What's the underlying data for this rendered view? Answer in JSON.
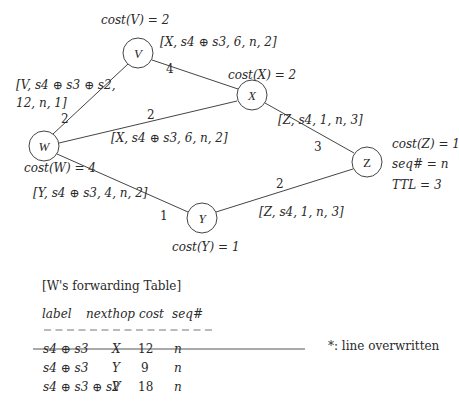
{
  "graph": {
    "nodes": [
      {
        "id": "V",
        "label": "V",
        "cx": 138,
        "cy": 53,
        "r": 15
      },
      {
        "id": "X",
        "label": "X",
        "cx": 252,
        "cy": 95,
        "r": 15
      },
      {
        "id": "W",
        "label": "W",
        "cx": 44,
        "cy": 146,
        "r": 15
      },
      {
        "id": "Z",
        "label": "Z",
        "cx": 367,
        "cy": 162,
        "r": 15
      },
      {
        "id": "Y",
        "label": "Y",
        "cx": 202,
        "cy": 218,
        "r": 15
      }
    ],
    "edges": [
      {
        "from": "W",
        "to": "V",
        "weight": "2"
      },
      {
        "from": "V",
        "to": "X",
        "weight": "4"
      },
      {
        "from": "W",
        "to": "X",
        "weight": "2"
      },
      {
        "from": "X",
        "to": "Z",
        "weight": "3"
      },
      {
        "from": "W",
        "to": "Y",
        "weight": "1"
      },
      {
        "from": "Y",
        "to": "Z",
        "weight": "2"
      }
    ],
    "costs": {
      "V": "cost(V) = 2",
      "X": "cost(X) = 2",
      "W": "cost(W) = 4",
      "Y": "cost(Y) = 1",
      "Z": "cost(Z) = 1"
    },
    "z_info": {
      "seq": "seq# = n",
      "ttl": "TTL = 3"
    },
    "messages": {
      "v_to_w_line1": "[V, s4 ⊕ s3 ⊕ s2,",
      "v_to_w_line2": "12, n, 1]",
      "x_to_v": "[X, s4 ⊕ s3, 6, n, 2]",
      "x_to_w": "[X, s4 ⊕ s3, 6, n, 2]",
      "z_to_x": "[Z, s4, 1, n, 3]",
      "y_to_w": "[Y, s4 ⊕ s3, 4, n, 2]",
      "z_to_y": "[Z, s4, 1, n, 3]"
    }
  },
  "table": {
    "title": "[W's forwarding Table]",
    "headers": [
      "label",
      "nexthop",
      "cost",
      "seq#"
    ],
    "separator": "– – – – – – – – – – – – – – –",
    "rows": [
      {
        "label": "s4 ⊕ s3",
        "nexthop": "X",
        "cost": "12",
        "seq": "n",
        "struck": true
      },
      {
        "label": "s4 ⊕ s3",
        "nexthop": "Y",
        "cost": "9",
        "seq": "n",
        "struck": false
      },
      {
        "label": "s4 ⊕ s3 ⊕ s2",
        "nexthop": "V",
        "cost": "18",
        "seq": "n",
        "struck": false
      }
    ],
    "footnote": "*: line overwritten"
  }
}
